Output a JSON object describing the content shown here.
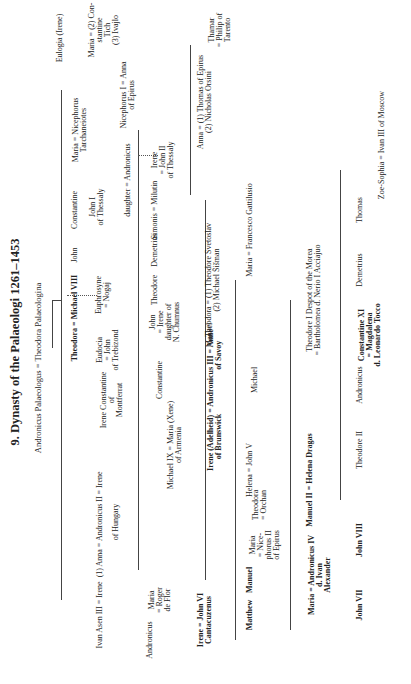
{
  "title": "9. Dynasty of the Palaeologi 1261–1453",
  "founders": "Andronicus Palaeologus = Theodora Palaeologina",
  "nodes": {
    "eulogia": "Eulogia (Irene)",
    "maria_tich": "Maria = (2) Con-\nstantine\nTich\n(3) Ivajlo",
    "maria_nic": "Maria = Nicephorus\nTarchaneiotes",
    "constantine": "Constantine",
    "john_thessaly": "John I\nof Thessaly",
    "john": "John",
    "michael_viii": "Theodora = Michael VIII",
    "euphrosyne": "Euphrosyne\n= Nogaj",
    "eudocia": "Eudocia\n= John\nof Trebizond",
    "irene_constantine": "Irene Constantine\nof\nMontferrat",
    "daughter_andronicus": "daughter = Andronicus",
    "nicephorus_anna": "Nicephorus I = Anna\nof Epirus",
    "simonis": "Simonis = Milutin",
    "irene_john2": "Irene\n= John II\nof Thessaly",
    "demetrius1": "Demetrius",
    "theodore1": "Theodore",
    "john_irene": "John\n= Irene\ndaughter of\nN. Chumnus",
    "constantine2": "Constantine",
    "andronicus_ii": "Ivan Asen III = Irene  (1) Anna = Andronicus II = Irene",
    "anna_hungary": "of Hungary",
    "anna_thomas": "Anna = (1) Thomas of Epirus\n(2) Nicholas Orsini",
    "thamar": "Thamar\n= Philip of\nTarento",
    "theodora_svetoslav": "Theodora = (1) Theodore Svetoslav\n(2) Michael Šišman",
    "manuel1": "Manuel",
    "andronicus_iii": "Irene (Adelheid) = Andronicus III = Anne\nof Brunswick                      of Savoy",
    "michael_ix": "Michael IX = Maria (Xene)\nof Armenia",
    "maria_roger": "Maria\n= Roger\nde Flor",
    "andronicus2": "Andronicus",
    "john_vi": "Irene = John VI\nCantacuzenus",
    "maria_gattilusio": "Maria = Francesco Gattilusio",
    "michael2": "Michael",
    "john_v": "Helena = John V",
    "theodora_orchan": "Theodora\n= Orchan",
    "maria_nic2": "Maria\n= Nice-\nphorus II\nof Epirus",
    "manuel2": "Manuel",
    "matthew": "Matthew",
    "theodore_i": "Theodore I Despot of the Morea\n= Bartholomea d. Nerio I Acciajuo",
    "manuel_ii": "Manuel II = Helena Dragas",
    "andronicus_iv": "Maria = Andronicus IV\nd. Ivan\nAlexander",
    "thomas": "Thomas",
    "zoe": "Zoe-Sophia = Ivan III of Moscow",
    "demetrius2": "Demetrius",
    "constantine_xi": "Constantine XI\n= Magdalena\nd. Leonardo Tocco",
    "andronicus3": "Andronicus",
    "theodore_ii": "Theodore II",
    "john_viii": "John VIII",
    "john_vii": "John VII"
  }
}
